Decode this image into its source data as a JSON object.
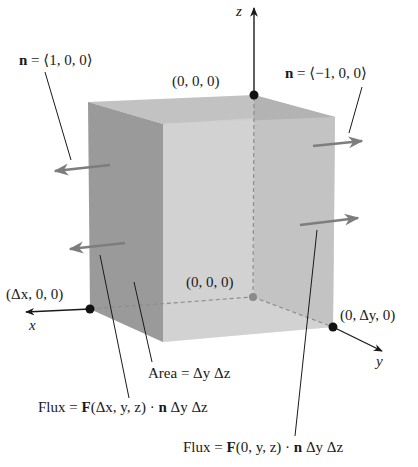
{
  "figure": {
    "colors": {
      "background": "#ffffff",
      "left_face": "#9a9a9a",
      "front_face": "#d0d0d0",
      "right_face": "#b3b3b3",
      "top_face": "#c2c2c2",
      "bottom_face": "#d6d6d6",
      "normal_arrow": "#7d7d7d",
      "axis": "#1a1a1a",
      "hidden_edge": "#8e8e8e",
      "origin_dot": "#8a8a8a"
    },
    "axes": {
      "x_label": "x",
      "y_label": "y",
      "z_label": "z"
    },
    "points": [
      {
        "name": "origin",
        "label": "(0, 0, 0)"
      },
      {
        "name": "z-top",
        "label": "(0, 0, Δz)"
      },
      {
        "name": "x-corner",
        "label": "(Δx, 0, 0)"
      },
      {
        "name": "y-corner",
        "label": "(0, Δy, 0)"
      }
    ],
    "normals": {
      "front_face": {
        "prefix": "n",
        "value": " = ⟨1, 0, 0⟩"
      },
      "back_face": {
        "prefix": "n",
        "value": " = ⟨−1, 0, 0⟩"
      }
    },
    "annotations": {
      "area": {
        "text": "Area = Δy Δz"
      },
      "flux_front": {
        "lead": "Flux = ",
        "F": "F",
        "args": "(Δx, y, z) · ",
        "n": "n",
        "tail": " Δy Δz"
      },
      "flux_back": {
        "lead": "Flux = ",
        "F": "F",
        "args": "(0, y, z) · ",
        "n": "n",
        "tail": " Δy Δz"
      }
    }
  }
}
